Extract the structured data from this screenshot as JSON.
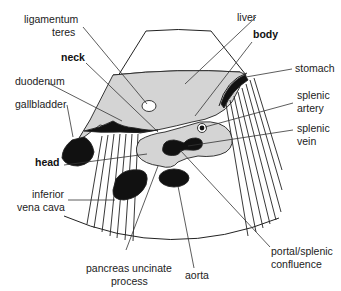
{
  "diagram": {
    "type": "ultrasound transverse section of pancreas",
    "colors": {
      "background": "#ffffff",
      "tissue_gray": "#d4d4d4",
      "vessel_black": "#111111",
      "line": "#222222"
    },
    "labels": {
      "ligamentum_teres_1": "ligamentum",
      "ligamentum_teres_2": "teres",
      "liver": "liver",
      "body": "body",
      "neck": "neck",
      "stomach": "stomach",
      "duodenum": "duodenum",
      "gallbladder": "gallbladder",
      "splenic_artery_1": "splenic",
      "splenic_artery_2": "artery",
      "splenic_vein_1": "splenic",
      "splenic_vein_2": "vein",
      "head": "head",
      "inferior_vena_cava_1": "inferior",
      "inferior_vena_cava_2": "vena cava",
      "portal_splenic_confluence_1": "portal/splenic",
      "portal_splenic_confluence_2": "confluence",
      "pancreas_uncinate_process_1": "pancreas uncinate",
      "pancreas_uncinate_process_2": "process",
      "aorta": "aorta"
    },
    "bold_labels": [
      "neck",
      "body",
      "head"
    ]
  }
}
